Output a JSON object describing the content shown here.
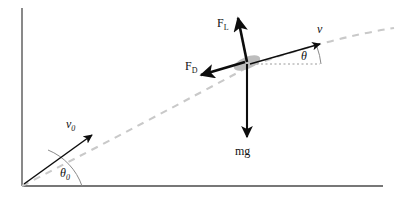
{
  "figure": {
    "background_color": "#ffffff"
  },
  "colors": {
    "axis": "#4a4a4a",
    "trajectory": "#c9c9c9",
    "vector": "#0d0d0d",
    "body_fill": "#bdbdbd",
    "angle_arc": "#8a8a8a",
    "dotted_ref": "#9a9a9a",
    "label": "#111111"
  },
  "axes": {
    "vertical": {
      "x": 22,
      "y_top": 8,
      "y_bottom": 186
    },
    "horizontal": {
      "y": 186,
      "x_left": 22,
      "x_right": 383
    }
  },
  "trajectory": {
    "name": "projectile-path",
    "style": "dashed",
    "path": "M 22 186 Q 150 120 250 66 Q 330 38 394 28"
  },
  "body": {
    "name": "projectile-body",
    "cx": 247,
    "cy": 63,
    "rx": 14,
    "ry": 6,
    "rotation": -22
  },
  "reference_line": {
    "name": "horizontal-reference",
    "x1": 252,
    "y1": 64,
    "x2": 320,
    "y2": 64,
    "style": "dotted"
  },
  "vectors": [
    {
      "id": "v0",
      "name": "initial-velocity-vector",
      "label": "v",
      "subscript": "0",
      "italic": true,
      "label_x": 70,
      "label_y": 128,
      "x1": 24,
      "y1": 184,
      "x2": 92,
      "y2": 135
    },
    {
      "id": "v",
      "name": "velocity-vector",
      "label": "v",
      "subscript": "",
      "italic": true,
      "label_x": 318,
      "label_y": 33,
      "x1": 250,
      "y1": 64,
      "x2": 320,
      "y2": 44
    },
    {
      "id": "FL",
      "name": "lift-force-vector",
      "label": "F",
      "subscript": "L",
      "italic": false,
      "label_x": 217,
      "label_y": 27,
      "x1": 247,
      "y1": 62,
      "x2": 237,
      "y2": 16
    },
    {
      "id": "FD",
      "name": "drag-force-vector",
      "label": "F",
      "subscript": "D",
      "italic": false,
      "label_x": 185,
      "label_y": 70,
      "x1": 245,
      "y1": 62,
      "x2": 199,
      "y2": 76
    },
    {
      "id": "mg",
      "name": "weight-vector",
      "label": "mg",
      "subscript": "",
      "italic": false,
      "label_x": 235,
      "label_y": 155,
      "x1": 247,
      "y1": 64,
      "x2": 247,
      "y2": 139
    }
  ],
  "angles": [
    {
      "id": "theta0",
      "name": "launch-angle",
      "label": "θ",
      "subscript": "0",
      "label_x": 62,
      "label_y": 176,
      "arc_path": "M 82 186 A 60 60 0 0 0 48 150",
      "vertex_x": 22,
      "vertex_y": 186
    },
    {
      "id": "theta",
      "name": "flight-path-angle",
      "label": "θ",
      "subscript": "",
      "label_x": 303,
      "label_y": 60,
      "arc_path": "M 320 64 A 70 70 0 0 0 316 48",
      "vertex_x": 250,
      "vertex_y": 64
    }
  ]
}
